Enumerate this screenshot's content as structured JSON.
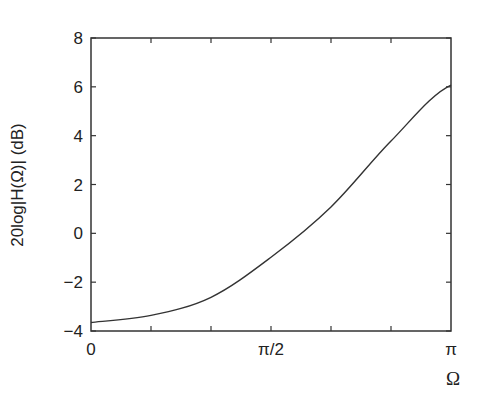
{
  "chart_data": {
    "type": "line",
    "title": "",
    "xlabel": "Ω",
    "ylabel": "20log|H(Ω)| (dB)",
    "xlim": [
      0,
      3.14159
    ],
    "ylim": [
      -4,
      8
    ],
    "x_tick_labels": [
      "0",
      "π/2",
      "π"
    ],
    "y_tick_labels": [
      "−4",
      "−2",
      "0",
      "2",
      "4",
      "6",
      "8"
    ],
    "y_ticks": [
      -4,
      -2,
      0,
      2,
      4,
      6,
      8
    ],
    "x_minor_ticks_per_half_pi": 3,
    "grid": false,
    "legend": null,
    "x": [
      "0",
      "π/6",
      "π/3",
      "π/2",
      "2π/3",
      "5π/6",
      "π"
    ],
    "x_numeric": [
      0,
      0.5236,
      1.0472,
      1.5708,
      2.0944,
      2.618,
      3.1416
    ],
    "series": [
      {
        "name": "20log|H(Ω)|",
        "values": [
          -3.65,
          -3.36,
          -2.62,
          -0.98,
          1.08,
          3.78,
          6.07
        ]
      }
    ]
  },
  "colors": {
    "line": "#333333",
    "axes": "#333333",
    "background": "#ffffff"
  }
}
